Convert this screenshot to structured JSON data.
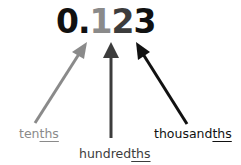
{
  "diagram": {
    "number": {
      "digits": [
        {
          "text": "0",
          "place": "ones",
          "color": "#111111"
        },
        {
          "text": ".",
          "place": "decimal-point",
          "color": "#111111"
        },
        {
          "text": "1",
          "place": "tenths",
          "color": "#8a8a8a"
        },
        {
          "text": "2",
          "place": "hundredths",
          "color": "#3c3c3c"
        },
        {
          "text": "3",
          "place": "thousandths",
          "color": "#111111"
        }
      ]
    },
    "labels": [
      {
        "stem": "ten",
        "suffix": "ths",
        "full": "tenths",
        "color": "#8a8a8a"
      },
      {
        "stem": "hundred",
        "suffix": "ths",
        "full": "hundredths",
        "color": "#3c3c3c"
      },
      {
        "stem": "thousand",
        "suffix": "ths",
        "full": "thousandths",
        "color": "#111111"
      }
    ],
    "arrows": [
      {
        "points_to": "1",
        "from": "tenths",
        "color": "#8a8a8a"
      },
      {
        "points_to": "2",
        "from": "hundredths",
        "color": "#3c3c3c"
      },
      {
        "points_to": "3",
        "from": "thousandths",
        "color": "#111111"
      }
    ]
  }
}
